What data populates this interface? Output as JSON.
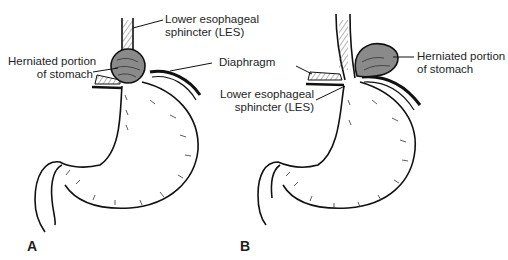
{
  "figure": {
    "panels": [
      {
        "letter": "A",
        "type": "sliding hiatal hernia",
        "labels": {
          "les_line1": "Lower esophageal",
          "les_line2": "sphincter (LES)",
          "herniated_line1": "Herniated portion",
          "herniated_line2": "of stomach",
          "diaphragm": "Diaphragm"
        }
      },
      {
        "letter": "B",
        "type": "paraesophageal (rolling) hiatal hernia",
        "labels": {
          "herniated_line1": "Herniated portion",
          "herniated_line2": "of stomach",
          "les_line1": "Lower esophageal",
          "les_line2": "sphincter (LES)"
        }
      }
    ],
    "colors": {
      "outline": "#111111",
      "hernia_fill": "#8a8a8a",
      "hatch": "#333333",
      "background": "#ffffff"
    }
  }
}
